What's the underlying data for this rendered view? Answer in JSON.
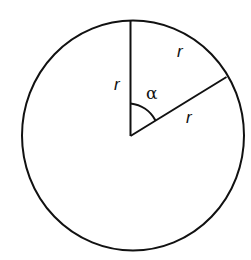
{
  "diagram": {
    "labels": {
      "radius_vertical": "r",
      "radius_slanted": "r",
      "arc_side": "r",
      "angle": "α"
    },
    "colors": {
      "stroke": "#111111",
      "background": "#ffffff"
    }
  }
}
